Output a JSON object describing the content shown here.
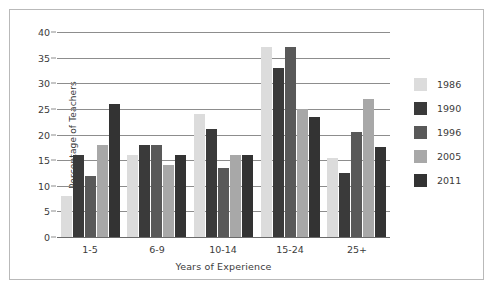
{
  "chart_data": {
    "type": "bar",
    "title": "",
    "xlabel": "Years of Experience",
    "ylabel": "Percentage of Teachers",
    "categories": [
      "1-5",
      "6-9",
      "10-14",
      "15-24",
      "25+"
    ],
    "ylim": [
      0,
      40
    ],
    "yticks": [
      0,
      5,
      10,
      15,
      20,
      25,
      30,
      35,
      40
    ],
    "ytick_labels": [
      "0",
      "5",
      "10",
      "15",
      "20",
      "25",
      "30",
      "35",
      "40"
    ],
    "grid": "horizontal",
    "legend_position": "right",
    "series": [
      {
        "name": "1986",
        "color": "#dcdcdc",
        "values": [
          8,
          16,
          24,
          37,
          15.5
        ]
      },
      {
        "name": "1990",
        "color": "#3a3a3a",
        "values": [
          16,
          18,
          21,
          33,
          12.5
        ]
      },
      {
        "name": "1996",
        "color": "#595959",
        "values": [
          12,
          18,
          13.5,
          37,
          20.5
        ]
      },
      {
        "name": "2005",
        "color": "#a8a8a8",
        "values": [
          18,
          14,
          16,
          25,
          27
        ]
      },
      {
        "name": "2011",
        "color": "#333333",
        "values": [
          26,
          16,
          16,
          23.5,
          17.5
        ]
      }
    ]
  },
  "style": {
    "border_color": "#b9b9b9",
    "gridline_color": "#8d8d8d",
    "axis_color": "#6b6b6b",
    "text_color": "#3b3b3b",
    "background": "#ffffff"
  }
}
